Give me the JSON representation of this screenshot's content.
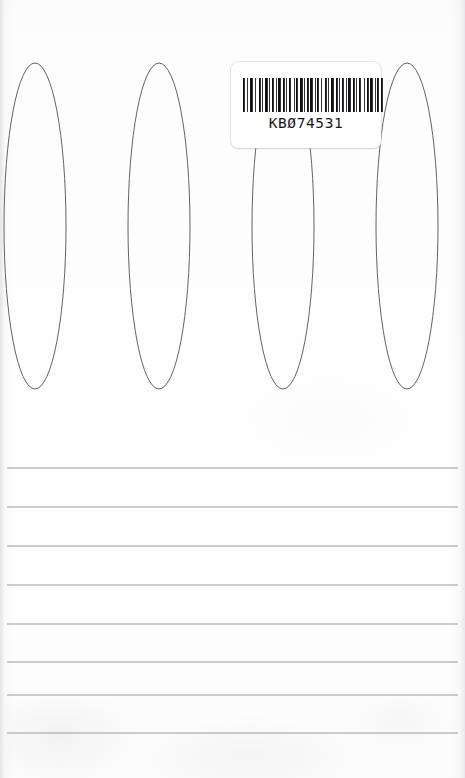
{
  "page": {
    "kind": "scanned-notebook-cover",
    "width": 465,
    "height": 778,
    "background_color": "#fcfcfc"
  },
  "spiral_binding": {
    "name": "spiral-wire-coil",
    "loop_count_visible": 5,
    "stroke_color": "#63636a",
    "stroke_width": 1.0,
    "loop_width": 62,
    "loop_height": 326,
    "top_y": 63,
    "bottom_y": 389,
    "centers_x": [
      -88,
      35,
      159,
      283,
      407
    ],
    "spacing_x": 123.5
  },
  "barcode_label": {
    "name": "barcode-sticker",
    "x": 231,
    "y": 62,
    "width": 150,
    "height": 86,
    "background_color": "#ffffff",
    "corner_radius": 7,
    "code_text": "KB074531",
    "code_text_zero_slashed": true,
    "bars_color": "#111113",
    "bars_x": 243,
    "bars_y": 78,
    "bars_width": 140,
    "bars_height": 34,
    "bar_pattern": [
      2,
      2,
      1,
      2,
      3,
      2,
      1,
      3,
      2,
      1,
      1,
      2,
      3,
      1,
      1,
      2,
      2,
      2,
      1,
      1,
      3,
      2,
      2,
      1,
      1,
      2,
      2,
      3,
      1,
      1,
      2,
      2,
      3,
      1,
      1,
      2,
      2,
      1,
      3,
      2,
      1,
      1,
      2,
      2,
      1,
      3,
      2,
      1,
      1,
      2,
      3,
      2,
      2,
      1,
      1,
      2,
      2,
      2,
      1,
      1,
      3,
      2,
      2,
      1,
      1,
      2,
      2,
      3,
      1,
      2,
      2,
      1,
      3,
      2,
      1,
      1,
      2,
      2,
      2
    ]
  },
  "ruled_lines": {
    "name": "ruled-note-lines",
    "count": 8,
    "stroke_color": "#9b9ba1",
    "stroke_width": 1.1,
    "x_start": 7,
    "x_end": 458,
    "y_positions": [
      468,
      507,
      546,
      585,
      624,
      662,
      695,
      733
    ],
    "spacing": 39
  }
}
